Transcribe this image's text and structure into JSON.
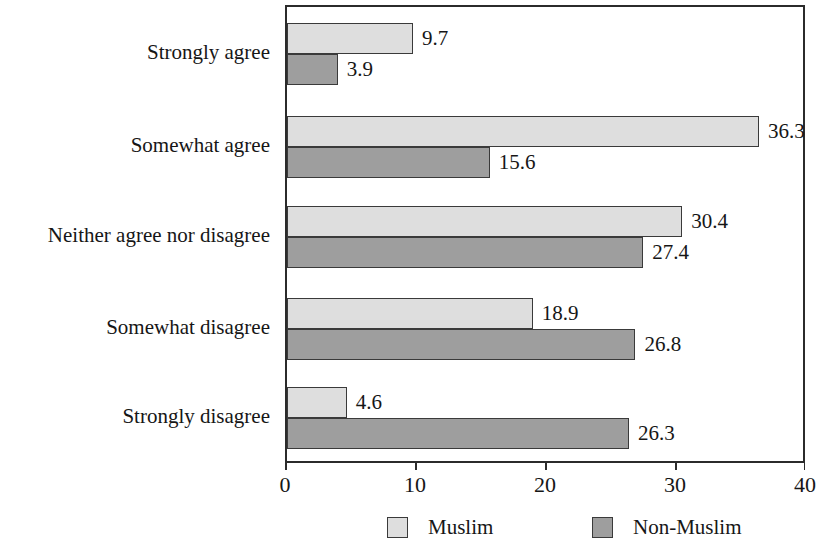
{
  "chart_data": {
    "type": "bar",
    "orientation": "horizontal",
    "title": "",
    "xlabel": "",
    "ylabel": "",
    "xlim": [
      0,
      40
    ],
    "xticks": [
      "0",
      "10",
      "20",
      "30",
      "40"
    ],
    "grid": false,
    "legend_position": "bottom",
    "categories": [
      "Strongly agree",
      "Somewhat agree",
      "Neither agree nor disagree",
      "Somewhat disagree",
      "Strongly disagree"
    ],
    "series": [
      {
        "name": "Muslim",
        "color": "#dedede",
        "values": [
          9.7,
          36.3,
          30.4,
          18.9,
          4.6
        ],
        "labels": [
          "9.7",
          "36.3",
          "30.4",
          "18.9",
          "4.6"
        ]
      },
      {
        "name": "Non-Muslim",
        "color": "#9e9e9e",
        "values": [
          3.9,
          15.6,
          27.4,
          26.8,
          26.3
        ],
        "labels": [
          "3.9",
          "15.6",
          "27.4",
          "26.8",
          "26.3"
        ]
      }
    ]
  },
  "legend": {
    "items": [
      {
        "label": "Muslim",
        "swatch": "muslim"
      },
      {
        "label": "Non-Muslim",
        "swatch": "nonmuslim"
      }
    ]
  }
}
